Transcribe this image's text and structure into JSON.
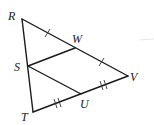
{
  "diagram": {
    "type": "geometry",
    "points": {
      "R": {
        "label": "R",
        "x": 22,
        "y": 19
      },
      "W": {
        "label": "W",
        "x": 75,
        "y": 48
      },
      "V": {
        "label": "V",
        "x": 128,
        "y": 76
      },
      "S": {
        "label": "S",
        "x": 28,
        "y": 66
      },
      "U": {
        "label": "U",
        "x": 81,
        "y": 94
      },
      "T": {
        "label": "T",
        "x": 33,
        "y": 112
      }
    },
    "segments": [
      {
        "from": "R",
        "to": "V",
        "via": "W"
      },
      {
        "from": "R",
        "to": "T",
        "via": "S"
      },
      {
        "from": "T",
        "to": "V",
        "via": "U"
      },
      {
        "from": "S",
        "to": "W"
      },
      {
        "from": "S",
        "to": "U"
      }
    ],
    "congruence_marks": [
      {
        "segment": "RW",
        "ticks": 1
      },
      {
        "segment": "WV",
        "ticks": 1
      },
      {
        "segment": "TU",
        "ticks": 2
      },
      {
        "segment": "UV",
        "ticks": 2
      }
    ],
    "labels": {
      "R": "R",
      "W": "W",
      "S": "S",
      "V": "V",
      "U": "U",
      "T": "T"
    }
  }
}
